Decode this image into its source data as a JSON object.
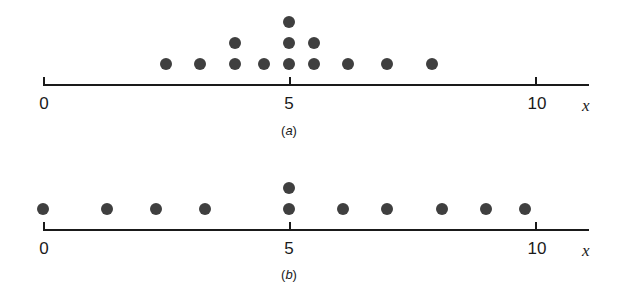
{
  "chart_data": [
    {
      "type": "scatter",
      "subtype": "dot_plot",
      "title": "(a)",
      "xlabel": "x",
      "ylabel": "",
      "xlim": [
        0,
        11
      ],
      "xticks": [
        0,
        5,
        10
      ],
      "xtick_labels": [
        "0",
        "5",
        "10"
      ],
      "grid": false,
      "legend": null,
      "points": [
        {
          "x": 2.5,
          "count": 1
        },
        {
          "x": 3.2,
          "count": 1
        },
        {
          "x": 3.9,
          "count": 2
        },
        {
          "x": 4.5,
          "count": 1
        },
        {
          "x": 5.0,
          "count": 3
        },
        {
          "x": 5.5,
          "count": 2
        },
        {
          "x": 6.2,
          "count": 1
        },
        {
          "x": 7.0,
          "count": 1
        },
        {
          "x": 7.9,
          "count": 1
        }
      ]
    },
    {
      "type": "scatter",
      "subtype": "dot_plot",
      "title": "(b)",
      "xlabel": "x",
      "ylabel": "",
      "xlim": [
        0,
        11
      ],
      "xticks": [
        0,
        5,
        10
      ],
      "xtick_labels": [
        "0",
        "5",
        "10"
      ],
      "grid": false,
      "legend": null,
      "points": [
        {
          "x": 0.0,
          "count": 1
        },
        {
          "x": 1.3,
          "count": 1
        },
        {
          "x": 2.3,
          "count": 1
        },
        {
          "x": 3.3,
          "count": 1
        },
        {
          "x": 5.0,
          "count": 2
        },
        {
          "x": 6.1,
          "count": 1
        },
        {
          "x": 7.0,
          "count": 1
        },
        {
          "x": 8.1,
          "count": 1
        },
        {
          "x": 9.0,
          "count": 1
        },
        {
          "x": 9.8,
          "count": 1
        }
      ]
    }
  ],
  "panels": [
    {
      "label_open": "(",
      "label_letter": "a",
      "label_close": ")",
      "x_axis_label": "x",
      "tick_labels": [
        "0",
        "5",
        "10"
      ]
    },
    {
      "label_open": "(",
      "label_letter": "b",
      "label_close": ")",
      "x_axis_label": "x",
      "tick_labels": [
        "0",
        "5",
        "10"
      ]
    }
  ],
  "style": {
    "dot_color": "#3f3f3f",
    "axis_color": "#1a1a1a",
    "background": "#ffffff"
  }
}
